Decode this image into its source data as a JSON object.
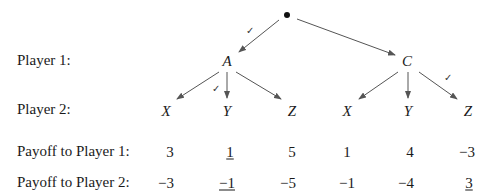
{
  "row_labels": {
    "player1": "Player 1:",
    "player2": "Player 2:",
    "payoff1": "Payoff to Player 1:",
    "payoff2": "Payoff to Player 2:"
  },
  "root": {
    "symbol": "•"
  },
  "player1_nodes": [
    {
      "label": "A",
      "chosen_by_root": true
    },
    {
      "label": "C",
      "chosen_by_root": false
    }
  ],
  "leaves": [
    {
      "parent": "A",
      "label": "X",
      "payoff1": "3",
      "payoff2": "−3",
      "checked": false,
      "underlined": false
    },
    {
      "parent": "A",
      "label": "Y",
      "payoff1": "1",
      "payoff2": "−1",
      "checked": true,
      "underlined": true
    },
    {
      "parent": "A",
      "label": "Z",
      "payoff1": "5",
      "payoff2": "−5",
      "checked": false,
      "underlined": false
    },
    {
      "parent": "C",
      "label": "X",
      "payoff1": "1",
      "payoff2": "−1",
      "checked": false,
      "underlined": false
    },
    {
      "parent": "C",
      "label": "Y",
      "payoff1": "4",
      "payoff2": "−4",
      "checked": false,
      "underlined": false
    },
    {
      "parent": "C",
      "label": "Z",
      "payoff1": "−3",
      "payoff2": "3",
      "checked": true,
      "underlined": true
    }
  ],
  "checkmark": "✓",
  "colors": {
    "text": "#1a1a1a",
    "edge": "#555555"
  }
}
